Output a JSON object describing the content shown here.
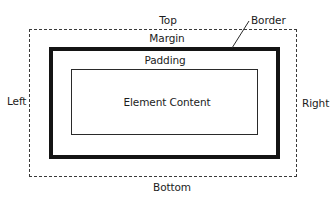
{
  "diagram": {
    "type": "css-box-model",
    "labels": {
      "top": "Top",
      "border": "Border",
      "margin": "Margin",
      "padding": "Padding",
      "content": "Element Content",
      "left": "Left",
      "right": "Right",
      "bottom": "Bottom"
    },
    "colors": {
      "margin_outline": "#3a3a3a",
      "border_outline": "#141414",
      "content_outline": "#2a2a2a",
      "background": "#ffffff",
      "text": "#1c1c1c"
    }
  }
}
